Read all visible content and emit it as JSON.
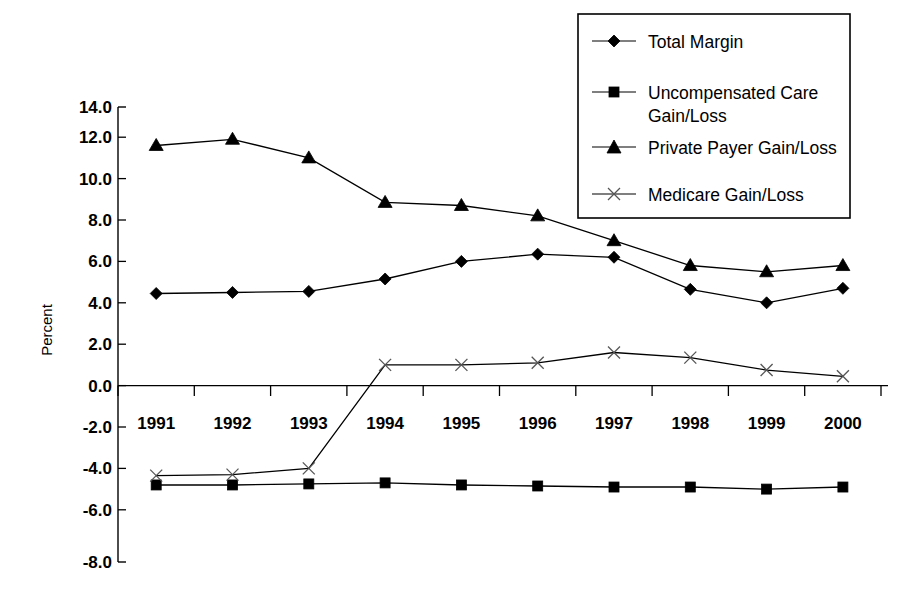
{
  "chart_data": {
    "type": "line",
    "title": "",
    "xlabel": "",
    "ylabel": "Percent",
    "categories": [
      "1991",
      "1992",
      "1993",
      "1994",
      "1995",
      "1996",
      "1997",
      "1998",
      "1999",
      "2000"
    ],
    "ylim": [
      -8.0,
      14.0
    ],
    "ytick_labels": [
      "14.0",
      "12.0",
      "10.0",
      "8.0",
      "6.0",
      "4.0",
      "2.0",
      "0.0",
      "-2.0",
      "-4.0",
      "-6.0",
      "-8.0"
    ],
    "ytick_values": [
      14.0,
      12.0,
      10.0,
      8.0,
      6.0,
      4.0,
      2.0,
      0.0,
      -2.0,
      -4.0,
      -6.0,
      -8.0
    ],
    "grid": false,
    "legend_position": "top-right",
    "series": [
      {
        "name": "Total Margin",
        "marker": "diamond",
        "values": [
          4.45,
          4.5,
          4.55,
          5.15,
          6.0,
          6.35,
          6.2,
          4.65,
          4.0,
          4.7
        ]
      },
      {
        "name": "Uncompensated Care Gain/Loss",
        "marker": "square",
        "values": [
          -4.8,
          -4.8,
          -4.75,
          -4.7,
          -4.8,
          -4.85,
          -4.9,
          -4.9,
          -5.0,
          -4.9
        ]
      },
      {
        "name": "Private Payer Gain/Loss",
        "marker": "triangle",
        "values": [
          11.6,
          11.9,
          11.0,
          8.85,
          8.7,
          8.2,
          7.0,
          5.8,
          5.5,
          5.8
        ]
      },
      {
        "name": "Medicare Gain/Loss",
        "marker": "x",
        "values": [
          -4.35,
          -4.3,
          -4.0,
          1.0,
          1.0,
          1.1,
          1.6,
          1.35,
          0.75,
          0.45
        ]
      }
    ]
  },
  "legend": {
    "entries": [
      {
        "label_line1": "Total Margin",
        "label_line2": ""
      },
      {
        "label_line1": "Uncompensated Care",
        "label_line2": "Gain/Loss"
      },
      {
        "label_line1": "Private Payer Gain/Loss",
        "label_line2": ""
      },
      {
        "label_line1": "Medicare Gain/Loss",
        "label_line2": ""
      }
    ]
  },
  "colors": {
    "ink": "#000000",
    "medicare_marker": "#555555",
    "background": "#ffffff"
  }
}
